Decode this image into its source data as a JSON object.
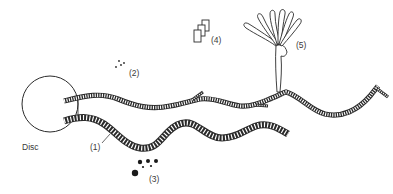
{
  "figure": {
    "labels": {
      "disc": "Disc",
      "item1": "(1)",
      "item2": "(2)",
      "item3": "(3)",
      "item4": "(4)",
      "item5": "(5)"
    },
    "colors": {
      "ink": "#2a2a2a",
      "background": "#ffffff"
    }
  }
}
